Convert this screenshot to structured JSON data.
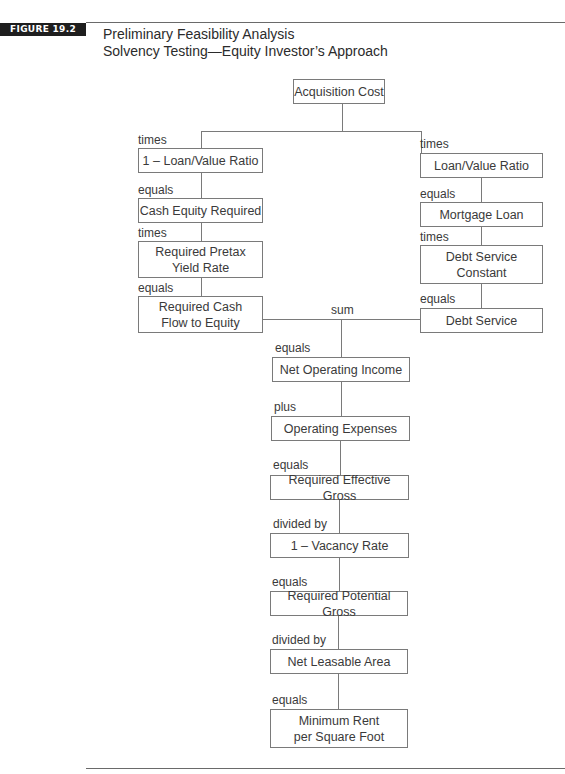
{
  "figure": {
    "badge": "FIGURE 19.2",
    "title_line1": "Preliminary Feasibility Analysis",
    "title_line2": "Solvency Testing—Equity Investor’s Approach"
  },
  "nodes": {
    "acquisition_cost": "Acquisition Cost",
    "one_minus_ltv": "1 – Loan/Value Ratio",
    "cash_equity_required": "Cash Equity Required",
    "required_pretax_yield_l1": "Required Pretax",
    "required_pretax_yield_l2": "Yield Rate",
    "required_cash_flow_l1": "Required Cash",
    "required_cash_flow_l2": "Flow to Equity",
    "ltv": "Loan/Value Ratio",
    "mortgage_loan": "Mortgage Loan",
    "debt_service_constant_l1": "Debt Service",
    "debt_service_constant_l2": "Constant",
    "debt_service": "Debt Service",
    "noi": "Net Operating Income",
    "operating_expenses": "Operating Expenses",
    "required_effective_gross": "Required Effective Gross",
    "one_minus_vacancy": "1 – Vacancy Rate",
    "required_potential_gross": "Required Potential Gross",
    "net_leasable_area": "Net Leasable Area",
    "min_rent_l1": "Minimum Rent",
    "min_rent_l2": "per Square Foot"
  },
  "operators": {
    "left_times_1": "times",
    "left_equals_1": "equals",
    "left_times_2": "times",
    "left_equals_2": "equals",
    "right_times_1": "times",
    "right_equals_1": "equals",
    "right_times_2": "times",
    "right_equals_2": "equals",
    "sum": "sum",
    "equals_noi": "equals",
    "plus": "plus",
    "equals_reg": "equals",
    "divided_by_1": "divided by",
    "equals_rpg": "equals",
    "divided_by_2": "divided by",
    "equals_final": "equals"
  }
}
